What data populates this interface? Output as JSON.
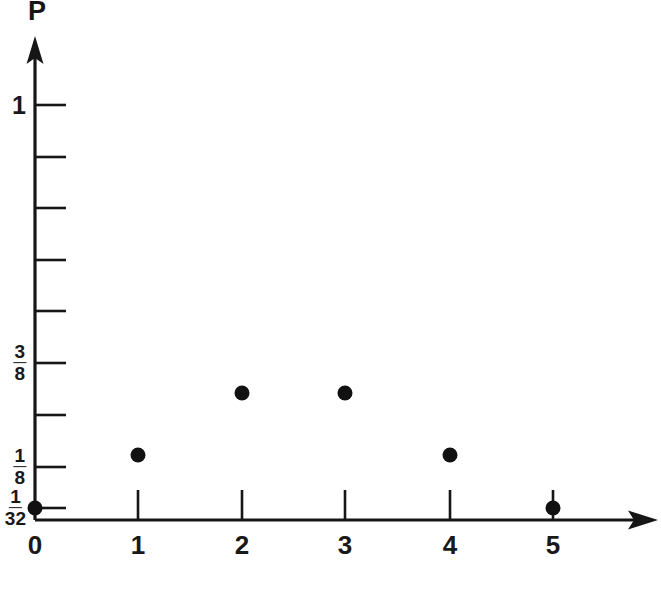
{
  "figure": {
    "y_axis_label": "P",
    "x_axis_label": "",
    "background_color": "#ffffff",
    "ink_color": "#161616"
  },
  "chart_data": {
    "type": "scatter",
    "title": "",
    "xlabel": "",
    "ylabel": "P",
    "x": [
      0,
      1,
      2,
      3,
      4,
      5
    ],
    "values": [
      0.03125,
      0.15625,
      0.3125,
      0.3125,
      0.15625,
      0.03125
    ],
    "value_labels": [
      "1/32",
      "5/32",
      "10/32",
      "10/32",
      "5/32",
      "1/32"
    ],
    "xlim": [
      0,
      5.6
    ],
    "ylim": [
      0,
      1.0
    ],
    "grid": false,
    "legend": null,
    "marker": "filled-circle",
    "marker_color": "#111111",
    "x_tick_labels": [
      "0",
      "1",
      "2",
      "3",
      "4",
      "5"
    ],
    "y_tick_labels": [
      {
        "value": 1.0,
        "label": "1",
        "kind": "integer"
      },
      {
        "value": 0.375,
        "numerator": "3",
        "denominator": "8",
        "kind": "fraction"
      },
      {
        "value": 0.125,
        "numerator": "1",
        "denominator": "8",
        "kind": "fraction"
      },
      {
        "value": 0.03125,
        "numerator": "1",
        "denominator": "32",
        "kind": "fraction"
      }
    ],
    "y_minor_ticks": [
      0.875,
      0.75,
      0.625,
      0.5,
      0.25
    ],
    "annotations": []
  },
  "axes": {
    "y_ticks": [
      {
        "y": 105,
        "label_kind": "integer",
        "label": "1"
      },
      {
        "y": 157,
        "label_kind": "none",
        "label": ""
      },
      {
        "y": 208,
        "label_kind": "none",
        "label": ""
      },
      {
        "y": 260,
        "label_kind": "none",
        "label": ""
      },
      {
        "y": 311,
        "label_kind": "none",
        "label": ""
      },
      {
        "y": 363,
        "label_kind": "fraction",
        "num": "3",
        "den": "8"
      },
      {
        "y": 415,
        "label_kind": "none",
        "label": ""
      },
      {
        "y": 467,
        "label_kind": "fraction",
        "num": "1",
        "den": "8"
      },
      {
        "y": 508,
        "label_kind": "fraction",
        "num": "1",
        "den": "32"
      }
    ],
    "x_ticks": [
      {
        "x": 35,
        "label": "0"
      },
      {
        "x": 138,
        "label": "1"
      },
      {
        "x": 242,
        "label": "2"
      },
      {
        "x": 345,
        "label": "3"
      },
      {
        "x": 450,
        "label": "4"
      },
      {
        "x": 553,
        "label": "5"
      }
    ]
  },
  "points": [
    {
      "cx": 35,
      "cy": 508,
      "x_label": "0",
      "p_label": "1/32"
    },
    {
      "cx": 138,
      "cy": 455,
      "x_label": "1",
      "p_label": "5/32"
    },
    {
      "cx": 242,
      "cy": 393,
      "x_label": "2",
      "p_label": "10/32"
    },
    {
      "cx": 345,
      "cy": 393,
      "x_label": "3",
      "p_label": "10/32"
    },
    {
      "cx": 450,
      "cy": 455,
      "x_label": "4",
      "p_label": "5/32"
    },
    {
      "cx": 553,
      "cy": 508,
      "x_label": "5",
      "p_label": "1/32"
    }
  ]
}
